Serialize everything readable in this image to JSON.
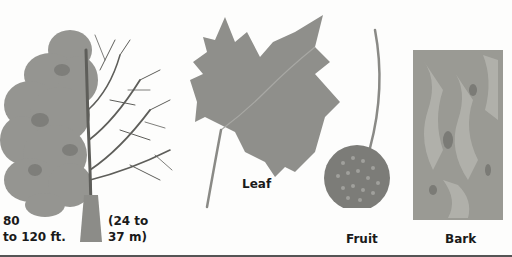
{
  "illustration": {
    "tree": {
      "height_ft_line1": "80",
      "height_ft_line2": "to 120 ft.",
      "height_m_line1": "(24 to",
      "height_m_line2": "37 m)"
    },
    "leaf": {
      "label": "Leaf"
    },
    "fruit": {
      "label": "Fruit"
    },
    "bark": {
      "label": "Bark"
    }
  },
  "colors": {
    "foliage": "#8a8a86",
    "branches": "#5e5e5a",
    "leaf": "#8f8f8b",
    "fruit": "#7c7c78",
    "bark": "#9a9a94",
    "background": "#fdfdfc",
    "text": "#1a1a1a"
  }
}
